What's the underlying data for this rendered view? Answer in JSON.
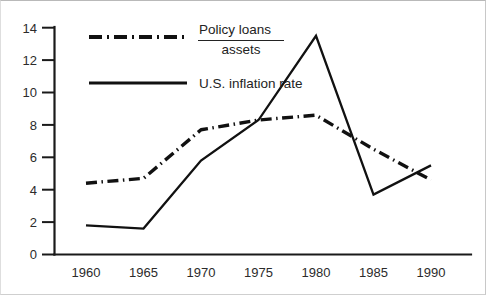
{
  "chart_data": {
    "type": "line",
    "title": "",
    "xlabel": "",
    "ylabel": "",
    "x": [
      1960,
      1965,
      1970,
      1975,
      1980,
      1985,
      1990
    ],
    "xticklabels": [
      "1960",
      "1965",
      "1970",
      "1975",
      "1980",
      "1985",
      "1990"
    ],
    "yticks": [
      0,
      2,
      4,
      6,
      8,
      10,
      12,
      14
    ],
    "yticklabels": [
      "0",
      "2",
      "4",
      "6",
      "8",
      "10",
      "12",
      "14"
    ],
    "xlim": [
      1960,
      1990
    ],
    "ylim": [
      0,
      14
    ],
    "grid": false,
    "legend_position": "upper-left-inside",
    "series": [
      {
        "name": "Policy loans / assets",
        "style": "dash-dot",
        "color": "#111111",
        "values": [
          4.4,
          4.7,
          7.7,
          8.3,
          8.6,
          6.5,
          4.6
        ]
      },
      {
        "name": "U.S. inflation rate",
        "style": "solid",
        "color": "#111111",
        "values": [
          1.8,
          1.6,
          5.8,
          8.3,
          13.5,
          3.7,
          5.5
        ]
      }
    ]
  },
  "legend": {
    "entry_policy_loans": {
      "numerator": "Policy loans",
      "denominator": "assets"
    },
    "entry_inflation": {
      "label": "U.S. inflation rate"
    }
  }
}
